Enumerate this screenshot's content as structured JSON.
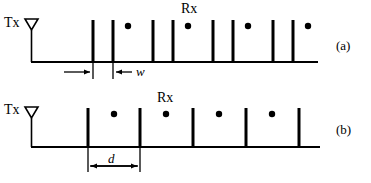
{
  "figure": {
    "stroke_color": "#000000",
    "background_color": "#ffffff",
    "panels": [
      {
        "id": "a",
        "panel_label": "(a)",
        "tx_label": "Tx",
        "rx_label": "Rx",
        "dimension_label": "w",
        "baseline_y": 62,
        "baseline_x0": 31,
        "baseline_x1": 318,
        "bar_top_y": 20,
        "tx_stem_x": 31,
        "tx_antenna_cy": 24,
        "tx_antenna_w": 13,
        "tx_antenna_h": 11,
        "bar_x": [
          93,
          113,
          153,
          173,
          213,
          233,
          273,
          293
        ],
        "dot_x": [
          128,
          188,
          248,
          308
        ],
        "dot_y": 26,
        "dot_r": 3,
        "rx_label_x": 182,
        "rx_label_y": 3,
        "dim_line_y": 73,
        "dim_tick_x": [
          93,
          113
        ],
        "dim_tick_top": 63,
        "dim_tick_bottom": 79,
        "dim_arrow_left_from": 62,
        "dim_arrow_left_to": 93,
        "dim_arrow_right_from": 132,
        "dim_arrow_right_to": 113,
        "dim_label_x": 137,
        "dim_label_y": 67
      },
      {
        "id": "b",
        "panel_label": "(b)",
        "tx_label": "Tx",
        "rx_label": "Rx",
        "dimension_label": "d",
        "baseline_y": 147,
        "baseline_x0": 31,
        "baseline_x1": 320,
        "bar_top_y": 108,
        "tx_stem_x": 31,
        "tx_antenna_cy": 112,
        "tx_antenna_w": 13,
        "tx_antenna_h": 11,
        "bar_x": [
          88,
          140,
          193,
          246,
          299
        ],
        "dot_x": [
          114,
          166,
          219,
          272
        ],
        "dot_y": 114,
        "dot_r": 3,
        "rx_label_x": 158,
        "rx_label_y": 92,
        "dim_line_y": 166,
        "dim_tick_x": [
          88,
          140
        ],
        "dim_tick_top": 148,
        "dim_tick_bottom": 172,
        "dim_arrow_left_from": 140,
        "dim_arrow_left_to": 88,
        "dim_label_x": 108,
        "dim_label_y": 156
      }
    ],
    "panel_label_x": 337,
    "panel_a_label_y": 45,
    "panel_b_label_y": 128
  }
}
